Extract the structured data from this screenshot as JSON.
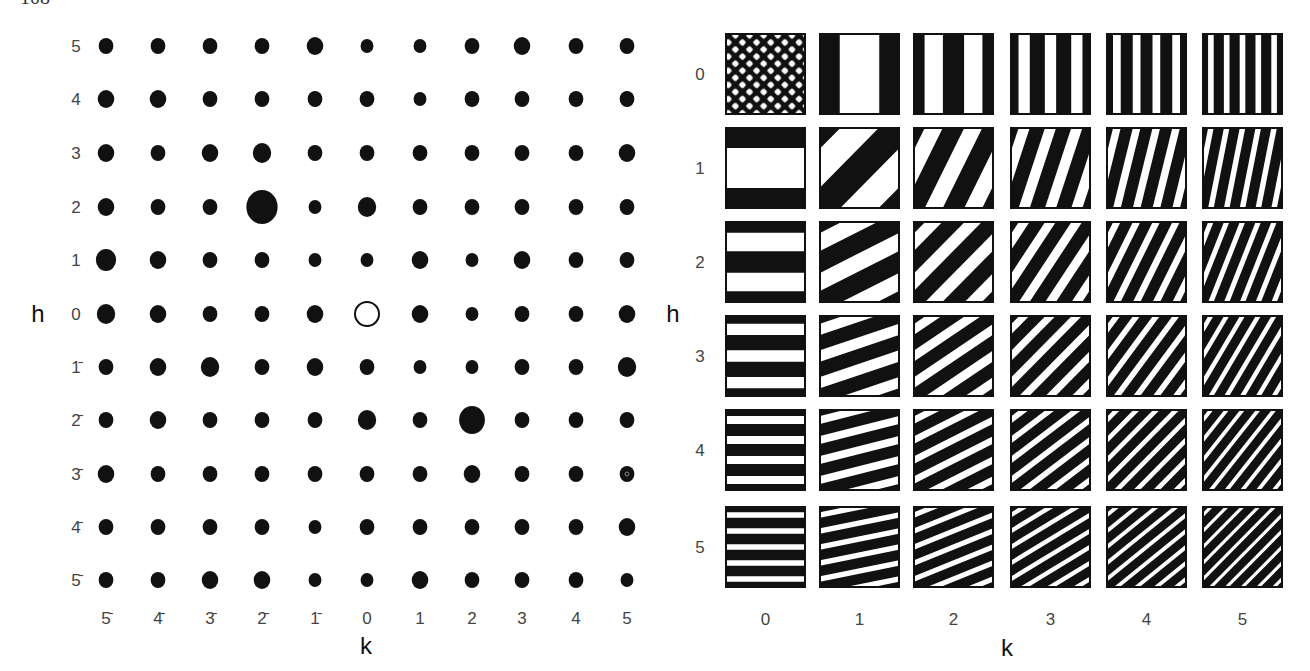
{
  "page_number": "108",
  "left_panel": {
    "title": "reciprocal lattice intensity map",
    "x_axis_label": "k",
    "y_axis_label": "h",
    "k_ticks": [
      "5̄",
      "4̄",
      "3̄",
      "2̄",
      "1̄",
      "0",
      "1",
      "2",
      "3",
      "4",
      "5"
    ],
    "h_ticks": [
      "5",
      "4",
      "3",
      "2",
      "1",
      "0",
      "1̄",
      "2̄",
      "3̄",
      "4̄",
      "5̄"
    ],
    "k_values": [
      -5,
      -4,
      -3,
      -2,
      -1,
      0,
      1,
      2,
      3,
      4,
      5
    ],
    "h_values": [
      5,
      4,
      3,
      2,
      1,
      0,
      -1,
      -2,
      -3,
      -4,
      -5
    ],
    "dot_color": "#111111",
    "origin_marker": "open-circle",
    "dot_radii": [
      [
        8,
        8,
        8,
        8,
        9,
        7,
        7,
        8,
        9,
        8,
        8
      ],
      [
        9,
        9,
        8,
        8,
        8,
        8,
        7,
        8,
        8,
        8,
        8
      ],
      [
        9,
        8,
        9,
        10,
        8,
        8,
        8,
        8,
        8,
        8,
        9
      ],
      [
        9,
        8,
        8,
        17,
        7,
        10,
        8,
        8,
        8,
        8,
        8
      ],
      [
        11,
        9,
        8,
        8,
        7,
        7,
        9,
        7,
        9,
        8,
        8
      ],
      [
        10,
        9,
        8,
        8,
        9,
        12,
        9,
        7,
        8,
        8,
        9
      ],
      [
        8,
        9,
        10,
        8,
        9,
        8,
        7,
        7,
        8,
        8,
        10
      ],
      [
        8,
        9,
        8,
        8,
        8,
        10,
        8,
        14,
        8,
        8,
        8
      ],
      [
        9,
        8,
        8,
        8,
        8,
        8,
        8,
        9,
        8,
        8,
        8
      ],
      [
        8,
        8,
        8,
        8,
        7,
        8,
        8,
        8,
        8,
        8,
        9
      ],
      [
        8,
        8,
        9,
        9,
        7,
        7,
        9,
        8,
        8,
        8,
        7
      ]
    ]
  },
  "right_panel": {
    "title": "Fourier component wave patterns",
    "x_axis_label": "k",
    "y_axis_label": "h",
    "k_ticks": [
      "0",
      "1",
      "2",
      "3",
      "4",
      "5"
    ],
    "h_ticks": [
      "0",
      "1",
      "2",
      "3",
      "4",
      "5"
    ],
    "cell_00_pattern": "crosshatch",
    "stripe_color": "#111111",
    "background_color": "#ffffff"
  },
  "chart_data": [
    {
      "type": "scatter",
      "title": "",
      "xlabel": "k",
      "ylabel": "h",
      "x": [
        -5,
        -4,
        -3,
        -2,
        -1,
        0,
        1,
        2,
        3,
        4,
        5
      ],
      "y": [
        5,
        4,
        3,
        2,
        1,
        0,
        -1,
        -2,
        -3,
        -4,
        -5
      ],
      "note": "dot size ~ intensity; origin (0,0) drawn as open circle; largest at (h=2,k=-2) and (h=-2,k=2)",
      "grid": false
    },
    {
      "type": "heatmap",
      "title": "",
      "xlabel": "k",
      "ylabel": "h",
      "categories_x": [
        0,
        1,
        2,
        3,
        4,
        5
      ],
      "categories_y": [
        0,
        1,
        2,
        3,
        4,
        5
      ],
      "note": "each cell shows stripes cos(2π(h·y + k·x)); (0,0) crosshatch"
    }
  ]
}
